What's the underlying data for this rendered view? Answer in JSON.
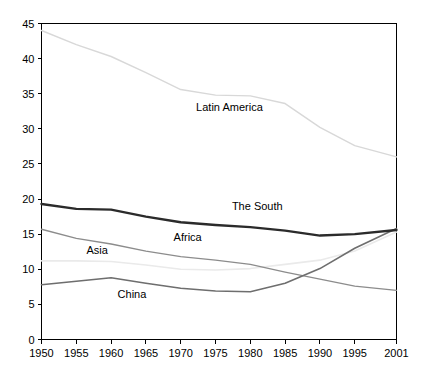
{
  "chart_data": {
    "type": "line",
    "title": "",
    "subtitle": "",
    "xlabel": "",
    "ylabel": "",
    "xlim": [
      1950,
      2001
    ],
    "ylim": [
      0,
      45
    ],
    "grid": false,
    "legend_position": "inline-labels",
    "x": [
      1950,
      1955,
      1960,
      1965,
      1970,
      1975,
      1980,
      1985,
      1990,
      1995,
      2001
    ],
    "xtick_labels": [
      "1950",
      "1955",
      "1960",
      "1965",
      "1970",
      "1975",
      "1980",
      "1985",
      "1990",
      "1995",
      "2001"
    ],
    "ytick_labels": [
      "0",
      "5",
      "10",
      "15",
      "20",
      "25",
      "30",
      "35",
      "40",
      "45"
    ],
    "yticks": [
      0,
      5,
      10,
      15,
      20,
      25,
      30,
      35,
      40,
      45
    ],
    "series": [
      {
        "name": "Latin America",
        "color": "#d8d8d8",
        "width": 1.4,
        "values": [
          44.0,
          42.0,
          40.3,
          38.0,
          35.6,
          34.8,
          34.7,
          33.6,
          30.2,
          27.6,
          26.0
        ],
        "label_x": 1977,
        "label_y": 32.5
      },
      {
        "name": "The South",
        "color": "#2b2b2b",
        "width": 2.4,
        "values": [
          19.3,
          18.6,
          18.5,
          17.5,
          16.7,
          16.3,
          16.0,
          15.5,
          14.8,
          15.0,
          15.6
        ],
        "label_x": 1981,
        "label_y": 18.5
      },
      {
        "name": "Africa",
        "color": "#8c8c8c",
        "width": 1.3,
        "values": [
          15.7,
          14.4,
          13.6,
          12.6,
          11.8,
          11.3,
          10.7,
          9.6,
          8.6,
          7.6,
          7.0
        ],
        "label_x": 1971,
        "label_y": 14.0
      },
      {
        "name": "Asia",
        "color": "#eaeaea",
        "width": 1.6,
        "values": [
          11.2,
          11.2,
          11.1,
          10.6,
          10.0,
          9.9,
          10.1,
          10.7,
          11.3,
          12.6,
          15.3
        ],
        "label_x": 1958,
        "label_y": 12.2
      },
      {
        "name": "China",
        "color": "#6e6e6e",
        "width": 1.6,
        "values": [
          7.8,
          8.3,
          8.8,
          8.0,
          7.3,
          6.9,
          6.8,
          8.0,
          10.1,
          13.0,
          15.8
        ],
        "label_x": 1963,
        "label_y": 5.9
      }
    ]
  },
  "axes": {
    "y_axis_name": "value-axis",
    "x_axis_name": "year-axis"
  }
}
